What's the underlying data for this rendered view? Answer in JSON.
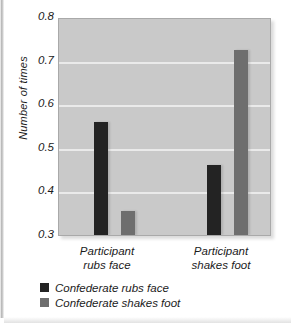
{
  "chart_data": {
    "type": "bar",
    "title": "",
    "xlabel": "",
    "ylabel": "Number of times",
    "ylim": [
      0.3,
      0.8
    ],
    "ytick_labels": [
      "0.8",
      "0.7",
      "0.6",
      "0.5",
      "0.4",
      "0.3"
    ],
    "yticks": [
      0.8,
      0.7,
      0.6,
      0.5,
      0.4,
      0.3
    ],
    "grid": true,
    "legend_position": "below-axes-left",
    "categories": [
      "Participant rubs face",
      "Participant shakes foot"
    ],
    "category_lines": [
      [
        "Participant",
        "rubs face"
      ],
      [
        "Participant",
        "shakes foot"
      ]
    ],
    "series": [
      {
        "name": "Confederate rubs face",
        "color": "#232323",
        "values": [
          0.56,
          0.46
        ]
      },
      {
        "name": "Confederate shakes foot",
        "color": "#6e6e6e",
        "values": [
          0.355,
          0.725
        ]
      }
    ],
    "plot_background": "#c9c9c9",
    "gridline_color": "#eaeaea"
  }
}
